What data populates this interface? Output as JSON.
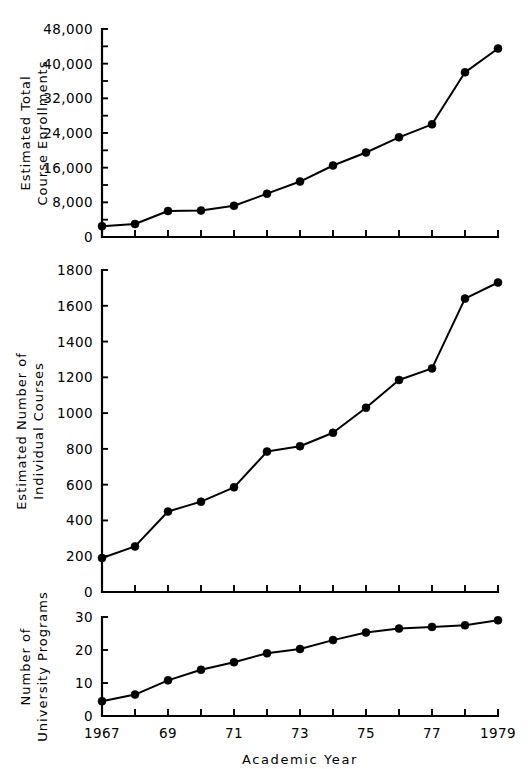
{
  "figure": {
    "title": "",
    "background": "#ffffff",
    "ink_color": "#000000"
  },
  "xaxis": {
    "label": "Academic Year",
    "tick_values": [
      1967,
      1968,
      1969,
      1970,
      1971,
      1972,
      1973,
      1974,
      1975,
      1976,
      1977,
      1978,
      1979
    ],
    "tick_labels": [
      "1967",
      "",
      "69",
      "",
      "71",
      "",
      "73",
      "",
      "75",
      "",
      "77",
      "",
      "1979"
    ],
    "range": [
      1967,
      1979
    ]
  },
  "chart_data": [
    {
      "type": "line",
      "panel": "top",
      "title": "",
      "ylabel": "Estimated Total Course Enrollments",
      "ylabel_lines": [
        "Estimated  Total",
        "Course  Enrollments"
      ],
      "xlabel": "",
      "ylim": [
        0,
        48000
      ],
      "ytick_values": [
        0,
        8000,
        16000,
        24000,
        32000,
        40000,
        48000
      ],
      "ytick_labels": [
        "0",
        "8,000",
        "16,000",
        "24,000",
        "32,000",
        "40,000",
        "48,000"
      ],
      "yminor_step": 4000,
      "grid": false,
      "legend": false,
      "marker": "filled-circle",
      "x": [
        1967,
        1968,
        1969,
        1970,
        1971,
        1972,
        1973,
        1974,
        1975,
        1976,
        1977,
        1978,
        1979
      ],
      "values": [
        2500,
        3000,
        6000,
        6100,
        7200,
        10000,
        12800,
        16500,
        19500,
        23000,
        26000,
        38000,
        43500
      ]
    },
    {
      "type": "line",
      "panel": "middle",
      "title": "",
      "ylabel": "Estimated Number of Individual Courses",
      "ylabel_lines": [
        "Estimated  Number  of",
        "Individual  Courses"
      ],
      "xlabel": "",
      "ylim": [
        0,
        1800
      ],
      "ytick_values": [
        0,
        200,
        400,
        600,
        800,
        1000,
        1200,
        1400,
        1600,
        1800
      ],
      "ytick_labels": [
        "0",
        "200",
        "400",
        "600",
        "800",
        "1000",
        "1200",
        "1400",
        "1600",
        "1800"
      ],
      "yminor_step": 0,
      "grid": false,
      "legend": false,
      "marker": "filled-circle",
      "x": [
        1967,
        1968,
        1969,
        1970,
        1971,
        1972,
        1973,
        1974,
        1975,
        1976,
        1977,
        1978,
        1979
      ],
      "values": [
        190,
        255,
        450,
        505,
        585,
        785,
        815,
        890,
        1030,
        1185,
        1250,
        1640,
        1730
      ]
    },
    {
      "type": "line",
      "panel": "bottom",
      "title": "",
      "ylabel": "Number of University Programs",
      "ylabel_lines": [
        "Number  of",
        "University  Programs"
      ],
      "xlabel": "Academic Year",
      "ylim": [
        0,
        30
      ],
      "ytick_values": [
        0,
        10,
        20,
        30
      ],
      "ytick_labels": [
        "0",
        "10",
        "20",
        "30"
      ],
      "yminor_step": 0,
      "grid": false,
      "legend": false,
      "marker": "filled-circle",
      "x": [
        1967,
        1968,
        1969,
        1970,
        1971,
        1972,
        1973,
        1974,
        1975,
        1976,
        1977,
        1978,
        1979
      ],
      "values": [
        4.5,
        6.5,
        10.8,
        14.0,
        16.3,
        19.0,
        20.3,
        23.0,
        25.3,
        26.5,
        27.0,
        27.5,
        29.0
      ]
    }
  ]
}
